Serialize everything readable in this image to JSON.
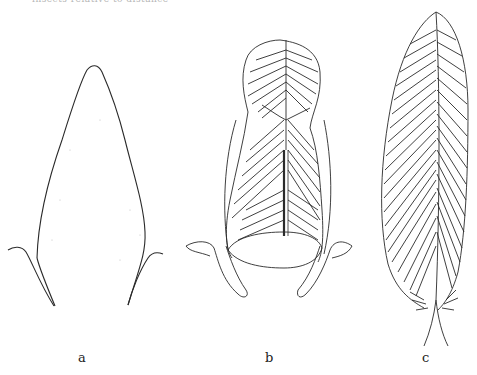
{
  "page": {
    "top_caption_cropped": "insects relative to distance",
    "figures": [
      {
        "id": "a",
        "label": "a",
        "description": "closed bud outline with two stipule-like curved bases"
      },
      {
        "id": "b",
        "label": "b",
        "description": "partially opened leaf with folded veined blade and stippled bases"
      },
      {
        "id": "c",
        "label": "c",
        "description": "fully expanded elongated leaf with parallel pinnate veins and midrib"
      }
    ],
    "colors": {
      "ink": "#2a2a2a",
      "paper": "#ffffff"
    }
  }
}
